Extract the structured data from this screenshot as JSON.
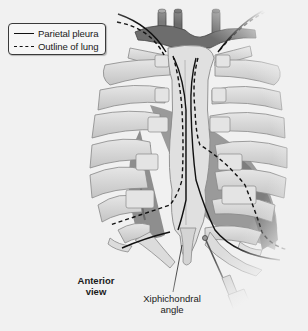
{
  "figure": {
    "view_label_line1": "Anterior",
    "view_label_line2": "view",
    "callout": {
      "line1": "Xiphichondral",
      "line2": "angle"
    }
  },
  "legend": {
    "items": [
      {
        "label": "Parietal pleura",
        "style": "solid"
      },
      {
        "label": "Outline of lung",
        "style": "dashed"
      }
    ]
  },
  "colors": {
    "background": "#f1f1f1",
    "bone": "#d9d9d9",
    "bone_outline": "#8a8a8a",
    "vessel": "#6f6f6f",
    "heart_shadow": "#8c8c8c",
    "line": "#111111"
  }
}
